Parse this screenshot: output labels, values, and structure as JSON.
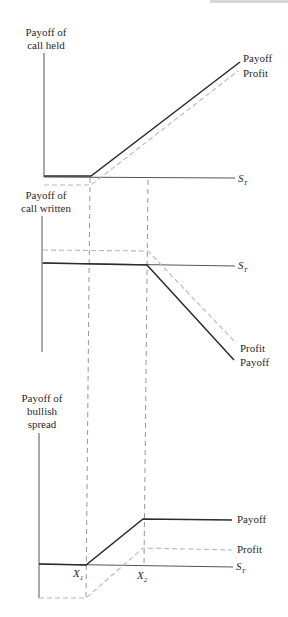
{
  "figure": {
    "panels": [
      {
        "id": "call-held",
        "ylabel": [
          "Payoff of",
          "call held"
        ],
        "xlabel": "S",
        "xlabel_sub": "T",
        "curve_labels": {
          "payoff": "Payoff",
          "profit": "Profit"
        }
      },
      {
        "id": "call-written",
        "ylabel": [
          "Payoff of",
          "call written"
        ],
        "xlabel": "S",
        "xlabel_sub": "T",
        "curve_labels": {
          "profit": "Profit",
          "payoff": "Payoff"
        }
      },
      {
        "id": "bullish-spread",
        "ylabel": [
          "Payoff of",
          "bullish",
          "spread"
        ],
        "xlabel": "S",
        "xlabel_sub": "T",
        "curve_labels": {
          "payoff": "Payoff",
          "profit": "Profit"
        },
        "strike_labels": [
          {
            "main": "X",
            "sub": "1"
          },
          {
            "main": "X",
            "sub": "2"
          }
        ]
      }
    ],
    "colors": {
      "payoff": "#2b2b2b",
      "profit": "#b8b8b8",
      "axis": "#555555",
      "guide": "#8a8a8a"
    }
  }
}
